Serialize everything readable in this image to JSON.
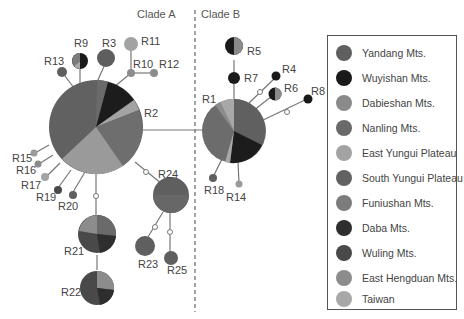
{
  "clades": {
    "a": "Clade A",
    "b": "Clade B"
  },
  "colors": {
    "yandang": "#5f5f5f",
    "wuyishan": "#1a1a1a",
    "dabieshan": "#8a8a8a",
    "nanling": "#6a6a6a",
    "east_yungui": "#a3a3a3",
    "south_yungui": "#626262",
    "funiushan": "#7c7c7c",
    "daba": "#2e2e2e",
    "wuling": "#494949",
    "east_hengduan": "#8c8c8c",
    "taiwan": "#a8a8a8"
  },
  "legend": {
    "items": [
      {
        "label": "Yandang Mts.",
        "color": "#5f5f5f"
      },
      {
        "label": "Wuyishan Mts.",
        "color": "#1a1a1a"
      },
      {
        "label": "Dabieshan Mts.",
        "color": "#8a8a8a"
      },
      {
        "label": "Nanling Mts.",
        "color": "#6a6a6a"
      },
      {
        "label": "East Yungui Plateau",
        "color": "#a3a3a3"
      },
      {
        "label": "South Yungui Plateau",
        "color": "#626262"
      },
      {
        "label": "Funiushan Mts.",
        "color": "#7c7c7c"
      },
      {
        "label": "Daba Mts.",
        "color": "#2e2e2e"
      },
      {
        "label": "Wuling Mts.",
        "color": "#494949"
      },
      {
        "label": "East Hengduan Mts.",
        "color": "#8c8c8c"
      },
      {
        "label": "Taiwan",
        "color": "#a8a8a8"
      }
    ]
  },
  "haplotypes": {
    "R1": "R1",
    "R2": "R2",
    "R3": "R3",
    "R4": "R4",
    "R5": "R5",
    "R6": "R6",
    "R7": "R7",
    "R8": "R8",
    "R9": "R9",
    "R10": "R10",
    "R11": "R11",
    "R12": "R12",
    "R13": "R13",
    "R14": "R14",
    "R15": "R15",
    "R16": "R16",
    "R17": "R17",
    "R18": "R18",
    "R19": "R19",
    "R20": "R20",
    "R21": "R21",
    "R22": "R22",
    "R23": "R23",
    "R24": "R24",
    "R25": "R25"
  }
}
